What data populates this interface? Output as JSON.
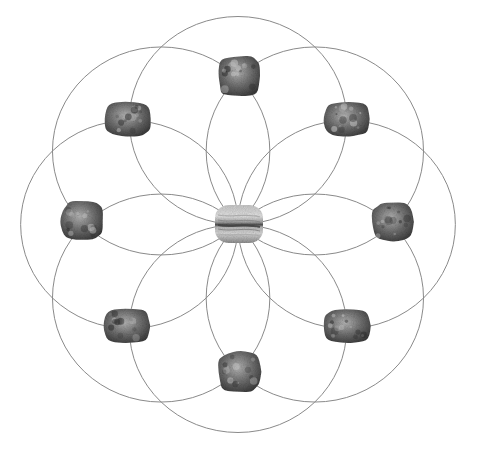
{
  "title": "Crystal grid: flower-of-life circle pattern with stones",
  "pattern": {
    "type": "flower-of-life",
    "circle_count": 8,
    "line_color": "#8a8a8a",
    "background_color": "#ffffff"
  },
  "stones": {
    "center": {
      "name": "Banded agate (center stone)",
      "style": "banded",
      "colors": [
        "#d9d9d9",
        "#9a9a9a",
        "#4a4a4a"
      ]
    },
    "outer": [
      {
        "name": "Rough stone (north)",
        "direction": "N",
        "style": "rough"
      },
      {
        "name": "Rough stone (north-east)",
        "direction": "NE",
        "style": "tumbled"
      },
      {
        "name": "Rough stone (east)",
        "direction": "E",
        "style": "rough"
      },
      {
        "name": "Rough stone (south-east)",
        "direction": "SE",
        "style": "tumbled"
      },
      {
        "name": "Rough stone (south)",
        "direction": "S",
        "style": "rough"
      },
      {
        "name": "Rough stone (south-west)",
        "direction": "SW",
        "style": "tumbled"
      },
      {
        "name": "Rough stone (west)",
        "direction": "W",
        "style": "rough"
      },
      {
        "name": "Rough stone (north-west)",
        "direction": "NW",
        "style": "tumbled"
      }
    ],
    "outer_colors": [
      "#cfcfcf",
      "#7a7a7a",
      "#3a3a3a"
    ]
  }
}
